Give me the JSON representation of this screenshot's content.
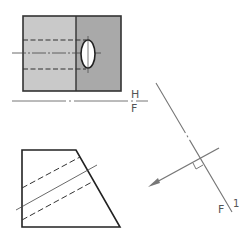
{
  "diagram": {
    "title": "",
    "fold_line_hf": {
      "upper_label": "H",
      "lower_label": "F"
    },
    "fold_line_f1": {
      "label_f": "F",
      "label_1": "1"
    },
    "colors": {
      "line": "#333333",
      "light_face": "#c9c9c9",
      "dark_face": "#a9a9a9",
      "thin_line": "#777777",
      "hole_fill": "#ffffff"
    },
    "views": [
      {
        "name": "top-view",
        "description": "Rectangular block with elliptical hole and hidden cylinder lines"
      },
      {
        "name": "front-view",
        "description": "Trapezoidal front view with hidden hole lines"
      },
      {
        "name": "auxiliary-fold",
        "description": "Inclined fold line F/1 with perpendicular view direction arrow"
      }
    ]
  }
}
